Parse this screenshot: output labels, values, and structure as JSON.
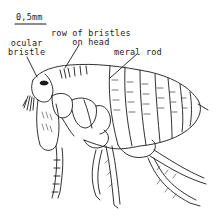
{
  "figure": {
    "scale_bar": {
      "label": "0,5mm"
    },
    "labels": [
      {
        "id": "ocular-bristle",
        "line1": "ocular",
        "line2": "bristle"
      },
      {
        "id": "row-of-bristles",
        "line1": "row of bristles",
        "line2": "on head"
      },
      {
        "id": "meral-rod",
        "line1": "meral rod"
      }
    ],
    "colors": {
      "ink": "#1a1a1a",
      "background": "#ffffff"
    }
  }
}
